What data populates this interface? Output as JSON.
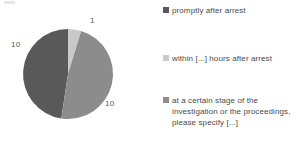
{
  "chart_data": {
    "type": "pie",
    "title": "",
    "subtitle": "",
    "xlabel": "",
    "ylabel": "",
    "grid": false,
    "legend_position": "right",
    "total": 21,
    "categories": [
      "promptly after arrest",
      "within [...] hours after arrest",
      "at a certain stage of the investigation or the proceedings, please specify [...]"
    ],
    "values": [
      10,
      1,
      10
    ],
    "data_labels": [
      "10",
      "1",
      "10"
    ],
    "colors": [
      "#595959",
      "#c9c9c9",
      "#8c8c8c"
    ],
    "slices": [
      {
        "label": "promptly after arrest",
        "value": 10,
        "data_label": "10",
        "color": "#595959",
        "percent": 47.6,
        "start_angle_deg": 188.6,
        "sweep_deg": 171.4
      },
      {
        "label": "within [...] hours after arrest",
        "value": 1,
        "data_label": "1",
        "color": "#c9c9c9",
        "percent": 4.8,
        "start_angle_deg": 0,
        "sweep_deg": 17.1
      },
      {
        "label": "at a certain stage of the investigation or the proceedings, please specify [...]",
        "value": 10,
        "data_label": "10",
        "color": "#8c8c8c",
        "percent": 47.6,
        "start_angle_deg": 17.1,
        "sweep_deg": 171.4
      }
    ]
  },
  "pie": {
    "label_left": "10",
    "label_top": "1",
    "label_right": "10"
  },
  "legend": {
    "items": [
      {
        "label": "promptly after arrest",
        "color": "#595959"
      },
      {
        "label": "within [...] hours after arrest",
        "color": "#c9c9c9"
      },
      {
        "label": "at a certain stage of the investigation or the proceedings, please specify [...]",
        "color": "#8c8c8c"
      }
    ]
  }
}
